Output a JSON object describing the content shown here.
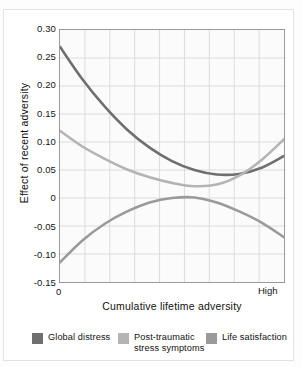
{
  "chart_data": {
    "type": "line",
    "title": "",
    "xlabel": "Cumulative lifetime adversity",
    "ylabel": "Effect of recent adversity",
    "xlim": [
      0,
      1
    ],
    "ylim": [
      -0.15,
      0.3
    ],
    "grid": true,
    "x_tick_labels": [
      "0",
      "High"
    ],
    "y_tick_labels": [
      "0.30",
      "0.25",
      "0.20",
      "0.15",
      "0.10",
      "0.05",
      "0",
      "-0.05",
      "-0.10",
      "-0.15"
    ],
    "y_tick_values": [
      0.3,
      0.25,
      0.2,
      0.15,
      0.1,
      0.05,
      0,
      -0.05,
      -0.1,
      -0.15
    ],
    "x_gridline_count": 9,
    "legend_position": "bottom",
    "x": [
      0,
      0.1,
      0.2,
      0.3,
      0.4,
      0.5,
      0.6,
      0.7,
      0.8,
      0.9,
      1.0
    ],
    "series": [
      {
        "name": "Global distress",
        "color": "#6f6f6f",
        "values": [
          0.27,
          0.212,
          0.163,
          0.122,
          0.09,
          0.066,
          0.05,
          0.042,
          0.043,
          0.054,
          0.075
        ]
      },
      {
        "name": "Post-traumatic\nstress symptoms",
        "color": "#b4b4b4",
        "values": [
          0.12,
          0.092,
          0.07,
          0.051,
          0.037,
          0.027,
          0.021,
          0.024,
          0.04,
          0.068,
          0.105
        ]
      },
      {
        "name": "Life satisfaction",
        "color": "#9a9a9a",
        "values": [
          -0.115,
          -0.076,
          -0.046,
          -0.024,
          -0.008,
          0.0,
          0.001,
          -0.008,
          -0.024,
          -0.044,
          -0.07
        ]
      }
    ]
  },
  "axes": {
    "y_title": "Effect of recent adversity",
    "x_title": "Cumulative lifetime adversity",
    "x_start_label": "0",
    "x_end_label": "High"
  },
  "legend": {
    "items": [
      {
        "label": "Global distress",
        "color": "#6f6f6f"
      },
      {
        "label": "Post-traumatic\nstress symptoms",
        "color": "#b4b4b4"
      },
      {
        "label": "Life satisfaction",
        "color": "#9a9a9a"
      }
    ]
  },
  "ticks": {
    "y": [
      "0.30",
      "0.25",
      "0.20",
      "0.15",
      "0.10",
      "0.05",
      "0",
      "-0.05",
      "-0.10",
      "-0.15"
    ]
  }
}
